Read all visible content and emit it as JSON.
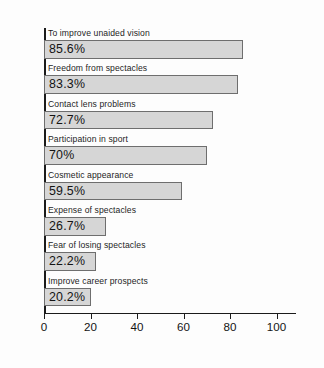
{
  "chart_data": {
    "type": "bar",
    "orientation": "horizontal",
    "title": "",
    "subtitle": "",
    "xlabel": "",
    "ylabel": "",
    "xlim": [
      0,
      108
    ],
    "grid": false,
    "legend": null,
    "axis": {
      "ticks": [
        0,
        20,
        40,
        60,
        80,
        100
      ],
      "tick_labels": [
        "0",
        "20",
        "40",
        "60",
        "80",
        "100"
      ]
    },
    "colors": {
      "bar_fill": "#d6d6d6",
      "bar_border": "#6e6e6e",
      "axis": "#1b1b1b",
      "text": "#141414",
      "background": "#fdfdfd"
    },
    "categories": [
      "To improve unaided vision",
      "Freedom from spectacles",
      "Contact lens problems",
      "Participation in sport",
      "Cosmetic appearance",
      "Expense of spectacles",
      "Fear of losing spectacles",
      "Improve career prospects"
    ],
    "values": [
      85.6,
      83.3,
      72.7,
      70,
      59.5,
      26.7,
      22.2,
      20.2
    ],
    "value_labels": [
      "85.6%",
      "83.3%",
      "72.7%",
      "70%",
      "59.5%",
      "26.7%",
      "22.2%",
      "20.2%"
    ]
  }
}
